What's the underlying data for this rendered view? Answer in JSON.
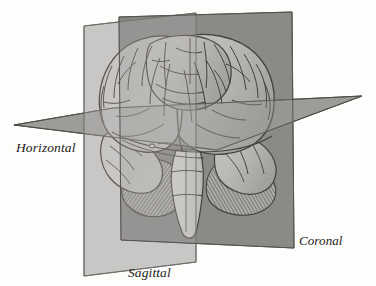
{
  "figure": {
    "background_color": "#fdfdfc"
  },
  "labels": {
    "horizontal": "Horizontal",
    "sagittal": "Sagittal",
    "coronal": "Coronal"
  },
  "planes": {
    "sagittal": {
      "name": "Sagittal",
      "orientation": "vertical, mid-line, left-leaning",
      "fill_color": "#c9c8c6",
      "stroke_color": "#6d6b68",
      "polygon": "84,26 196,13 196,262 84,276"
    },
    "coronal": {
      "name": "Coronal",
      "orientation": "vertical, frontal",
      "fill_color": "#8b8a88",
      "stroke_color": "#5a5856",
      "polygon": "119,17 292,12 294,248 121,240"
    },
    "horizontal": {
      "name": "Horizontal",
      "orientation": "flat, transverse",
      "fill_color": "#9c9b98",
      "stroke_color": "#5f5d5a",
      "polygon": "14,125 113,108 362,96 217,150"
    }
  },
  "brain": {
    "cerebrum_fill": "#cbcac7",
    "cerebrum_stroke": "#2b2825",
    "cerebellum_fill": "#b9b8b4",
    "cerebellum_hatch": "#3a3734",
    "brainstem_fill": "#e2e1dd",
    "sulci_color": "#2a2724"
  },
  "colors": {
    "label_text": "#1d1a18",
    "page_background": "#ffffff"
  }
}
